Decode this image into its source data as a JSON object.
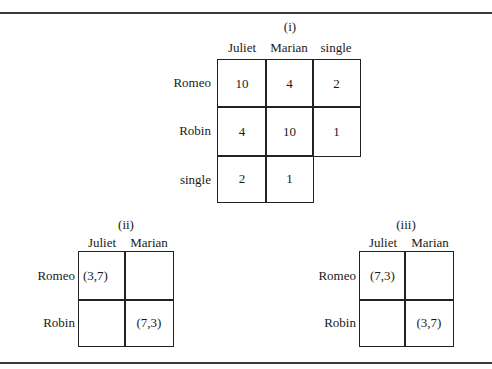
{
  "figure": {
    "panels": [
      {
        "id": "i",
        "title": "(i)",
        "columns": [
          "Juliet",
          "Marian",
          "single"
        ],
        "rows": [
          "Romeo",
          "Robin",
          "single"
        ],
        "cells": [
          [
            "10",
            "4",
            "2"
          ],
          [
            "4",
            "10",
            "1"
          ],
          [
            "2",
            "1",
            null
          ]
        ]
      },
      {
        "id": "ii",
        "title": "(ii)",
        "columns": [
          "Juliet",
          "Marian"
        ],
        "rows": [
          "Romeo",
          "Robin"
        ],
        "cells": [
          [
            "(3,7)",
            ""
          ],
          [
            "",
            "(7,3)"
          ]
        ]
      },
      {
        "id": "iii",
        "title": "(iii)",
        "columns": [
          "Juliet",
          "Marian"
        ],
        "rows": [
          "Romeo",
          "Robin"
        ],
        "cells": [
          [
            "(7,3)",
            ""
          ],
          [
            "",
            "(3,7)"
          ]
        ]
      }
    ]
  }
}
